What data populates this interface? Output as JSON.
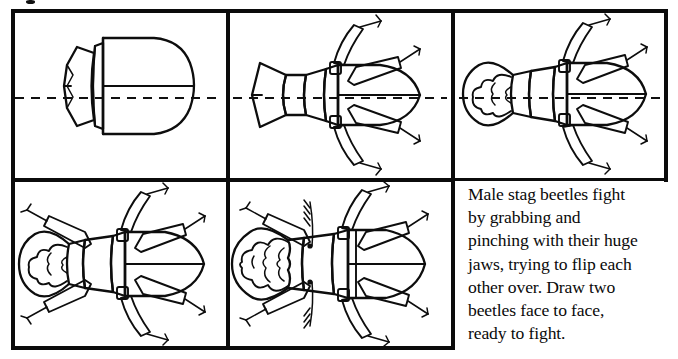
{
  "illustration": {
    "subject": "stag-beetle",
    "kind": "step-by-step drawing tutorial",
    "panel_count": 5,
    "construction_axis": "horizontal dashed centerline through top row of panels"
  },
  "panels": [
    {
      "index": 1,
      "name": "panel-step-1",
      "step_description": "basic body shapes: abdomen dome, thorax trapezoid and head block on the centerline"
    },
    {
      "index": 2,
      "name": "panel-step-2",
      "step_description": "add the front and middle legs and define the head plate"
    },
    {
      "index": 3,
      "name": "panel-step-3",
      "step_description": "add the large curved stag jaws around the head"
    },
    {
      "index": 4,
      "name": "panel-step-4",
      "step_description": "add all six legs and the wing case seam"
    },
    {
      "index": 5,
      "name": "panel-step-5",
      "step_description": "finish with antennae, eyes and the toothed inner edges of the jaws"
    }
  ],
  "caption": {
    "name": "instruction-caption",
    "lines": [
      "Male stag beetles fight",
      "by grabbing and",
      "pinching with their huge",
      "jaws, trying to flip each",
      "other over. Draw two",
      "beetles face to face,",
      "ready to fight."
    ],
    "full_text": "Male stag beetles fight by grabbing and pinching with their huge jaws, trying to flip each other over. Draw two beetles face to face, ready to fight."
  },
  "colors": {
    "ink": "#0d0d0d",
    "paper": "#ffffff",
    "frame": "#0b0b0b"
  }
}
